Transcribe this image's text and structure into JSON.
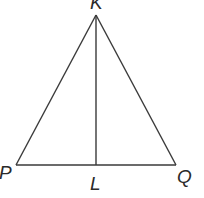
{
  "diagram": {
    "type": "triangle",
    "vertices": {
      "K": {
        "label": "K",
        "x": 96,
        "y": 15
      },
      "P": {
        "label": "P",
        "x": 16,
        "y": 165
      },
      "Q": {
        "label": "Q",
        "x": 176,
        "y": 165
      },
      "L": {
        "label": "L",
        "x": 96,
        "y": 165
      }
    },
    "segments": [
      "KP",
      "KQ",
      "PQ",
      "KL"
    ],
    "colors": {
      "line": "#3a3a3a",
      "text": "#2a2a2a",
      "background": "#ffffff"
    }
  }
}
